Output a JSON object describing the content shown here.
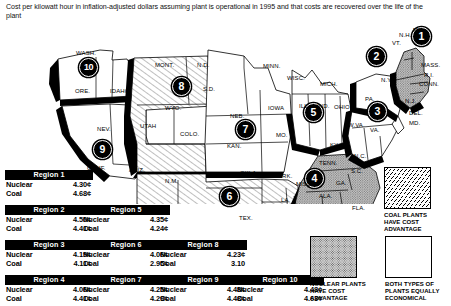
{
  "title": "Cost per kilowatt hour in inflation-adjusted dollars assuming plant is operational in 1995 and that costs are recovered over the life of the plant",
  "map": {
    "badges": [
      {
        "num": "1",
        "x": 420,
        "y": 35
      },
      {
        "num": "2",
        "x": 375,
        "y": 55
      },
      {
        "num": "3",
        "x": 376,
        "y": 110
      },
      {
        "num": "4",
        "x": 313,
        "y": 177
      },
      {
        "num": "5",
        "x": 312,
        "y": 111
      },
      {
        "num": "6",
        "x": 228,
        "y": 195
      },
      {
        "num": "7",
        "x": 244,
        "y": 128
      },
      {
        "num": "8",
        "x": 180,
        "y": 85
      },
      {
        "num": "9",
        "x": 101,
        "y": 148
      },
      {
        "num": "10",
        "x": 87,
        "y": 66
      }
    ],
    "states": [
      {
        "name": "WASH.",
        "x": 76,
        "y": 50
      },
      {
        "name": "ORE.",
        "x": 75,
        "y": 88
      },
      {
        "name": "IDAHO",
        "x": 110,
        "y": 88
      },
      {
        "name": "NEV.",
        "x": 97,
        "y": 126
      },
      {
        "name": "CALIF.",
        "x": 87,
        "y": 165
      },
      {
        "name": "ARIZ.",
        "x": 129,
        "y": 167
      },
      {
        "name": "UTAH",
        "x": 140,
        "y": 123
      },
      {
        "name": "MONT.",
        "x": 155,
        "y": 62
      },
      {
        "name": "WYO.",
        "x": 165,
        "y": 105
      },
      {
        "name": "COLO.",
        "x": 180,
        "y": 131
      },
      {
        "name": "N.M.",
        "x": 165,
        "y": 178
      },
      {
        "name": "N.D.",
        "x": 197,
        "y": 62
      },
      {
        "name": "S.D.",
        "x": 203,
        "y": 86
      },
      {
        "name": "NEB.",
        "x": 230,
        "y": 113
      },
      {
        "name": "KAN.",
        "x": 227,
        "y": 143
      },
      {
        "name": "OKLA.",
        "x": 240,
        "y": 170
      },
      {
        "name": "TEX.",
        "x": 239,
        "y": 215
      },
      {
        "name": "MINN.",
        "x": 263,
        "y": 63
      },
      {
        "name": "IOWA",
        "x": 268,
        "y": 105
      },
      {
        "name": "MO.",
        "x": 276,
        "y": 132
      },
      {
        "name": "ARK.",
        "x": 278,
        "y": 173
      },
      {
        "name": "LA.",
        "x": 281,
        "y": 197
      },
      {
        "name": "WISC.",
        "x": 287,
        "y": 75
      },
      {
        "name": "ILL.",
        "x": 299,
        "y": 103
      },
      {
        "name": "IND.",
        "x": 317,
        "y": 103
      },
      {
        "name": "MICH.",
        "x": 320,
        "y": 81
      },
      {
        "name": "OHIO",
        "x": 334,
        "y": 104
      },
      {
        "name": "KY.",
        "x": 330,
        "y": 142
      },
      {
        "name": "TENN.",
        "x": 319,
        "y": 160
      },
      {
        "name": "MISS.",
        "x": 296,
        "y": 181
      },
      {
        "name": "ALA.",
        "x": 319,
        "y": 193
      },
      {
        "name": "FLA.",
        "x": 352,
        "y": 205
      },
      {
        "name": "GA.",
        "x": 336,
        "y": 180
      },
      {
        "name": "S.C.",
        "x": 351,
        "y": 168
      },
      {
        "name": "N.C.",
        "x": 354,
        "y": 153
      },
      {
        "name": "VA.",
        "x": 370,
        "y": 127
      },
      {
        "name": "W.VA.",
        "x": 348,
        "y": 122
      },
      {
        "name": "PA.",
        "x": 365,
        "y": 96
      },
      {
        "name": "N.Y.",
        "x": 381,
        "y": 77
      },
      {
        "name": "VT.",
        "x": 392,
        "y": 40
      },
      {
        "name": "N.H.",
        "x": 399,
        "y": 32
      },
      {
        "name": "ME.",
        "x": 413,
        "y": 27
      },
      {
        "name": "MASS.",
        "x": 421,
        "y": 62
      },
      {
        "name": "R.I.",
        "x": 424,
        "y": 72
      },
      {
        "name": "CONN.",
        "x": 419,
        "y": 81
      },
      {
        "name": "N.J.",
        "x": 405,
        "y": 98
      },
      {
        "name": "DEL.",
        "x": 409,
        "y": 110
      },
      {
        "name": "MD.",
        "x": 409,
        "y": 120
      }
    ]
  },
  "tables": [
    {
      "title": "Region 1",
      "nuclear_label": "Nuclear",
      "nuclear": "4.30¢",
      "coal_label": "Coal",
      "coal": "4.68¢",
      "x": 5,
      "y": 170
    },
    {
      "title": "Region 2",
      "nuclear_label": "Nuclear",
      "nuclear": "4.50¢",
      "coal_label": "Coal",
      "coal": "4.41¢",
      "x": 5,
      "y": 205
    },
    {
      "title": "Region 3",
      "nuclear_label": "Nuclear",
      "nuclear": "4.19¢",
      "coal_label": "Coal",
      "coal": "4.11¢",
      "x": 5,
      "y": 240
    },
    {
      "title": "Region 4",
      "nuclear_label": "Nuclear",
      "nuclear": "4.06¢",
      "coal_label": "Coal",
      "coal": "4.41¢",
      "x": 5,
      "y": 275
    },
    {
      "title": "Region 5",
      "nuclear_label": "Nuclear",
      "nuclear": "4.35¢",
      "coal_label": "Coal",
      "coal": "4.24¢",
      "x": 82,
      "y": 205
    },
    {
      "title": "Region 6",
      "nuclear_label": "Nuclear",
      "nuclear": "4.06¢",
      "coal_label": "Coal",
      "coal": "2.95¢",
      "x": 82,
      "y": 240
    },
    {
      "title": "Region 7",
      "nuclear_label": "Nuclear",
      "nuclear": "4.25¢",
      "coal_label": "Coal",
      "coal": "4.29¢",
      "x": 82,
      "y": 275
    },
    {
      "title": "Region 8",
      "nuclear_label": "Nuclear",
      "nuclear": "4.23¢",
      "coal_label": "Coal",
      "coal": "3.10",
      "x": 159,
      "y": 240
    },
    {
      "title": "Region 9",
      "nuclear_label": "Nuclear",
      "nuclear": "4.48¢",
      "coal_label": "Coal",
      "coal": "4.48¢",
      "x": 159,
      "y": 275
    },
    {
      "title": "Region 10",
      "nuclear_label": "Nuclear",
      "nuclear": "4.48¢",
      "coal_label": "Coal",
      "coal": "4.63¢",
      "x": 236,
      "y": 275
    }
  ],
  "legend": [
    {
      "key": "coal",
      "swatch": "hatch",
      "caption": "COAL PLANTS\nHAVE COST\nADVANTAGE",
      "x": 384,
      "y": 167
    },
    {
      "key": "nuclear",
      "swatch": "dots",
      "caption": "NUCLEAR PLANTS\nHAVE COST\nADVANTAGE",
      "x": 310,
      "y": 236
    },
    {
      "key": "equal",
      "swatch": "white",
      "caption": "BOTH TYPES OF\nPLANTS EQUALLY\nECONOMICAL",
      "x": 385,
      "y": 236
    }
  ],
  "chart_data": {
    "type": "table",
    "title": "Cost per kilowatt hour in inflation-adjusted dollars assuming plant is operational in 1995 and that costs are recovered over the life of the plant",
    "columns": [
      "Region",
      "Nuclear",
      "Coal",
      "Advantage"
    ],
    "units": "cents per kilowatt hour",
    "rows": [
      {
        "region": "Region 1",
        "nuclear": 4.3,
        "coal": 4.68,
        "advantage": "nuclear",
        "states": [
          "ME",
          "N.H.",
          "VT.",
          "MASS.",
          "R.I.",
          "CONN."
        ]
      },
      {
        "region": "Region 2",
        "nuclear": 4.5,
        "coal": 4.41,
        "advantage": "equal",
        "states": [
          "N.Y.",
          "N.J."
        ]
      },
      {
        "region": "Region 3",
        "nuclear": 4.19,
        "coal": 4.11,
        "advantage": "equal",
        "states": [
          "PA.",
          "W.VA.",
          "VA.",
          "MD.",
          "DEL."
        ]
      },
      {
        "region": "Region 4",
        "nuclear": 4.06,
        "coal": 4.41,
        "advantage": "nuclear",
        "states": [
          "KY.",
          "TENN.",
          "MISS.",
          "ALA.",
          "GA.",
          "FLA.",
          "S.C.",
          "N.C."
        ]
      },
      {
        "region": "Region 5",
        "nuclear": 4.35,
        "coal": 4.24,
        "advantage": "equal",
        "states": [
          "WISC.",
          "MICH.",
          "ILL.",
          "IND.",
          "OHIO"
        ]
      },
      {
        "region": "Region 6",
        "nuclear": 4.06,
        "coal": 2.95,
        "advantage": "coal",
        "states": [
          "N.M.",
          "TEX.",
          "OKLA.",
          "ARK.",
          "LA."
        ]
      },
      {
        "region": "Region 7",
        "nuclear": 4.25,
        "coal": 4.29,
        "advantage": "equal",
        "states": [
          "MINN.",
          "IOWA",
          "NEB.",
          "KAN.",
          "MO."
        ]
      },
      {
        "region": "Region 8",
        "nuclear": 4.23,
        "coal": 3.1,
        "advantage": "coal",
        "states": [
          "MONT.",
          "N.D.",
          "S.D.",
          "WYO.",
          "UTAH",
          "COLO."
        ]
      },
      {
        "region": "Region 9",
        "nuclear": 4.48,
        "coal": 4.48,
        "advantage": "equal",
        "states": [
          "NEV.",
          "CALIF.",
          "ARIZ."
        ]
      },
      {
        "region": "Region 10",
        "nuclear": 4.48,
        "coal": 4.63,
        "advantage": "coal",
        "states": [
          "WASH.",
          "ORE.",
          "IDAHO"
        ]
      }
    ]
  },
  "colors": {
    "ink": "#000000",
    "paper": "#ffffff",
    "nuclear_fill": "#cfcfcf",
    "coal_hatch": "#000000"
  }
}
